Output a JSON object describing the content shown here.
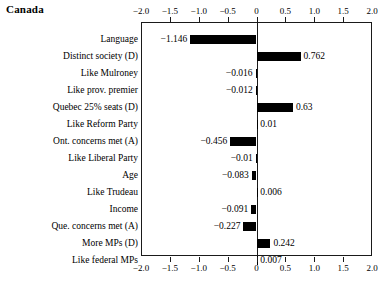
{
  "chart_data": {
    "type": "bar",
    "orientation": "horizontal",
    "title": "Canada",
    "xlabel": "",
    "ylabel": "",
    "xlim": [
      -2.0,
      2.0
    ],
    "grid": false,
    "legend": null,
    "axis_top": true,
    "axis_bottom": true,
    "tick_labels": [
      "-2.0",
      "-1.5",
      "-1.0",
      "-0.5",
      "0",
      "0.5",
      "1.0",
      "1.5",
      "2.0"
    ],
    "ticks": [
      -2.0,
      -1.5,
      -1.0,
      -0.5,
      0,
      0.5,
      1.0,
      1.5,
      2.0
    ],
    "tick_marks_drawn": [
      -1.5,
      -1.0,
      -0.5,
      0,
      0.5,
      1.0,
      1.5
    ],
    "bar_color": "#000000",
    "categories": [
      "Language",
      "Distinct society (D)",
      "Like Mulroney",
      "Like prov. premier",
      "Quebec 25% seats (D)",
      "Like Reform Party",
      "Ont. concerns met (A)",
      "Like Liberal Party",
      "Age",
      "Like Trudeau",
      "Income",
      "Que. concerns met (A)",
      "More MPs (D)",
      "Like federal MPs"
    ],
    "values": [
      -1.146,
      0.762,
      -0.016,
      -0.012,
      0.63,
      0.01,
      -0.456,
      -0.01,
      -0.083,
      0.006,
      -0.091,
      -0.227,
      0.242,
      0.007
    ],
    "value_labels": [
      "-1.146",
      "0.762",
      "-0.016",
      "-0.012",
      "0.63",
      "0.01",
      "-0.456",
      "-0.01",
      "-0.083",
      "0.006",
      "-0.091",
      "-0.227",
      "0.242",
      "0.007"
    ]
  }
}
